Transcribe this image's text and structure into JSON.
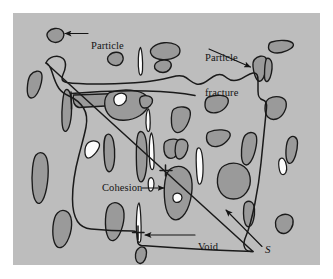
{
  "figure": {
    "background_color": "#ffffff",
    "panel_color": "#bdbdbd",
    "particle_fill": "#9a9a9a",
    "void_fill": "#fdfdfd",
    "outline_color": "#1a1a1a"
  },
  "labels": {
    "particle": "Particle",
    "particle_fracture_line1": "Particle",
    "particle_fracture_line2": "fracture",
    "cohesion": "Cohesion",
    "void": "Void",
    "surface": "S"
  },
  "annotations": [
    {
      "name": "particle",
      "text": "Particle",
      "arrow": "left",
      "target": "small particle, upper-left"
    },
    {
      "name": "particle-fracture",
      "text": "Particle fracture",
      "arrow": "down-right",
      "target": "cracked particle, upper-right"
    },
    {
      "name": "cohesion",
      "text": "Cohesion",
      "arrow": "right",
      "target": "inter-particle contact, center"
    },
    {
      "name": "void",
      "text": "Void",
      "arrow": "left",
      "target": "thin white sliver, lower-center"
    },
    {
      "name": "surface",
      "text": "S",
      "arrow": "up-left",
      "target": "failure surface boundary curve"
    }
  ],
  "elements": {
    "particle_count": 30,
    "void_count": 7,
    "boundary_curve_label": "S"
  }
}
